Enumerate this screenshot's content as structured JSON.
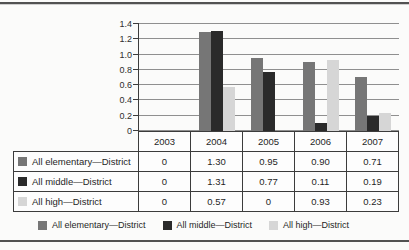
{
  "chart_data": {
    "type": "bar",
    "title": "",
    "xlabel": "",
    "ylabel": "",
    "categories": [
      "2003",
      "2004",
      "2005",
      "2006",
      "2007"
    ],
    "series": [
      {
        "name": "All elementary—District",
        "color": "#767676",
        "values": [
          0,
          1.3,
          0.95,
          0.9,
          0.71
        ],
        "display": [
          "0",
          "1.30",
          "0.95",
          "0.90",
          "0.71"
        ]
      },
      {
        "name": "All middle—District",
        "color": "#2a2a2a",
        "values": [
          0,
          1.31,
          0.77,
          0.11,
          0.19
        ],
        "display": [
          "0",
          "1.31",
          "0.77",
          "0.11",
          "0.19"
        ]
      },
      {
        "name": "All high—District",
        "color": "#d6d6d6",
        "values": [
          0,
          0.57,
          0,
          0.93,
          0.23
        ],
        "display": [
          "0",
          "0.57",
          "0",
          "0.93",
          "0.23"
        ]
      }
    ],
    "ylim": [
      0,
      1.4
    ],
    "ytick_step": 0.2,
    "ytick_labels": [
      "0",
      "0.2",
      "0.4",
      "0.6",
      "0.8",
      "1.0",
      "1.2",
      "1.4"
    ],
    "grid": "horizontal",
    "legend_position": "bottom",
    "data_table_attached": true
  },
  "colors": {
    "axis": "#3c3c3c",
    "gridline": "#8f8f8f",
    "table_border": "#3c3c3c",
    "rule": "#525252",
    "background": "#fbfbfa"
  }
}
